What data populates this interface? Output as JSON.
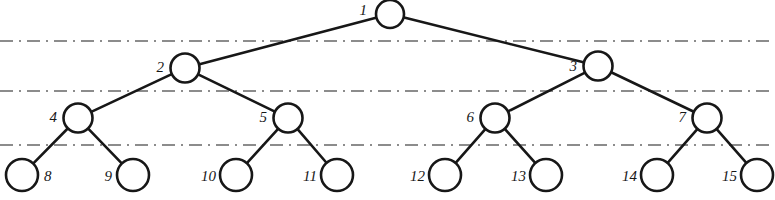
{
  "figure": {
    "kind": "binary-tree-diagram",
    "width": 775,
    "height": 200,
    "background_color": "#ffffff",
    "stroke_color": "#171717",
    "node_fill_color": "#ffffff",
    "separator_color": "#8c8c8c"
  },
  "nodes": [
    {
      "id": "n1",
      "label": "1",
      "cx": 390,
      "cy": 14,
      "r": 14,
      "level": 0,
      "label_x": 367,
      "label_y": 10,
      "label_anchor": "right"
    },
    {
      "id": "n2",
      "label": "2",
      "cx": 185,
      "cy": 68,
      "r": 14.5,
      "level": 1,
      "label_x": 164,
      "label_y": 67,
      "label_anchor": "right"
    },
    {
      "id": "n3",
      "label": "3",
      "cx": 598,
      "cy": 66,
      "r": 14.5,
      "level": 1,
      "label_x": 577,
      "label_y": 66,
      "label_anchor": "right"
    },
    {
      "id": "n4",
      "label": "4",
      "cx": 78,
      "cy": 118,
      "r": 14.5,
      "level": 2,
      "label_x": 57,
      "label_y": 117,
      "label_anchor": "right"
    },
    {
      "id": "n5",
      "label": "5",
      "cx": 288,
      "cy": 118,
      "r": 14.5,
      "level": 2,
      "label_x": 267,
      "label_y": 117,
      "label_anchor": "right"
    },
    {
      "id": "n6",
      "label": "6",
      "cx": 495,
      "cy": 118,
      "r": 14.5,
      "level": 2,
      "label_x": 474,
      "label_y": 117,
      "label_anchor": "right"
    },
    {
      "id": "n7",
      "label": "7",
      "cx": 707,
      "cy": 118,
      "r": 14.5,
      "level": 2,
      "label_x": 686,
      "label_y": 117,
      "label_anchor": "right"
    },
    {
      "id": "n8",
      "label": "8",
      "cx": 22,
      "cy": 175,
      "r": 16,
      "level": 3,
      "label_x": 44,
      "label_y": 176,
      "label_anchor": "left"
    },
    {
      "id": "n9",
      "label": "9",
      "cx": 133,
      "cy": 175,
      "r": 16,
      "level": 3,
      "label_x": 112,
      "label_y": 176,
      "label_anchor": "right"
    },
    {
      "id": "n10",
      "label": "10",
      "cx": 236,
      "cy": 175,
      "r": 16,
      "level": 3,
      "label_x": 216,
      "label_y": 176,
      "label_anchor": "right"
    },
    {
      "id": "n11",
      "label": "11",
      "cx": 337,
      "cy": 175,
      "r": 16,
      "level": 3,
      "label_x": 317,
      "label_y": 176,
      "label_anchor": "right"
    },
    {
      "id": "n12",
      "label": "12",
      "cx": 445,
      "cy": 175,
      "r": 16,
      "level": 3,
      "label_x": 425,
      "label_y": 176,
      "label_anchor": "right"
    },
    {
      "id": "n13",
      "label": "13",
      "cx": 546,
      "cy": 175,
      "r": 16,
      "level": 3,
      "label_x": 526,
      "label_y": 176,
      "label_anchor": "right"
    },
    {
      "id": "n14",
      "label": "14",
      "cx": 657,
      "cy": 175,
      "r": 16,
      "level": 3,
      "label_x": 637,
      "label_y": 176,
      "label_anchor": "right"
    },
    {
      "id": "n15",
      "label": "15",
      "cx": 757,
      "cy": 175,
      "r": 16,
      "level": 3,
      "label_x": 737,
      "label_y": 176,
      "label_anchor": "right"
    }
  ],
  "edges": [
    {
      "id": "e1-2",
      "from": "n1",
      "to": "n2"
    },
    {
      "id": "e1-3",
      "from": "n1",
      "to": "n3"
    },
    {
      "id": "e2-4",
      "from": "n2",
      "to": "n4"
    },
    {
      "id": "e2-5",
      "from": "n2",
      "to": "n5"
    },
    {
      "id": "e3-6",
      "from": "n3",
      "to": "n6"
    },
    {
      "id": "e3-7",
      "from": "n3",
      "to": "n7"
    },
    {
      "id": "e4-8",
      "from": "n4",
      "to": "n8"
    },
    {
      "id": "e4-9",
      "from": "n4",
      "to": "n9"
    },
    {
      "id": "e5-10",
      "from": "n5",
      "to": "n10"
    },
    {
      "id": "e5-11",
      "from": "n5",
      "to": "n11"
    },
    {
      "id": "e6-12",
      "from": "n6",
      "to": "n12"
    },
    {
      "id": "e6-13",
      "from": "n6",
      "to": "n13"
    },
    {
      "id": "e7-14",
      "from": "n7",
      "to": "n14"
    },
    {
      "id": "e7-15",
      "from": "n7",
      "to": "n15"
    }
  ],
  "separators": [
    {
      "id": "sep-1",
      "y": 41,
      "x1": 0,
      "x2": 775
    },
    {
      "id": "sep-2",
      "y": 91,
      "x1": 0,
      "x2": 775
    },
    {
      "id": "sep-3",
      "y": 145,
      "x1": 0,
      "x2": 775
    }
  ]
}
